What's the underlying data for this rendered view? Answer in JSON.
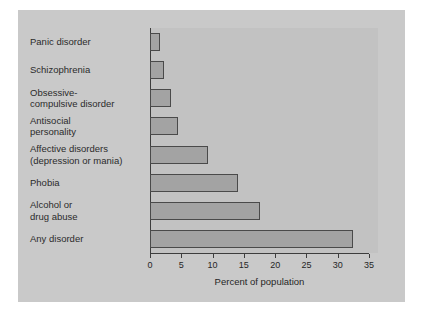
{
  "chart_data": {
    "type": "bar",
    "orientation": "horizontal",
    "title": "",
    "xlabel": "Percent of population",
    "ylabel": "",
    "xlim": [
      0,
      35
    ],
    "xticks": [
      0,
      5,
      10,
      15,
      20,
      25,
      30,
      35
    ],
    "xtick_labels": [
      "0",
      "5",
      "10",
      "15",
      "20",
      "25",
      "30",
      "35"
    ],
    "grid": false,
    "legend": null,
    "categories": [
      "Panic disorder",
      "Schizophrenia",
      "Obsessive-\ncompulsive disorder",
      "Antisocial\npersonality",
      "Affective disorders\n(depression or mania)",
      "Phobia",
      "Alcohol or\ndrug abuse",
      "Any disorder"
    ],
    "values": [
      1.6,
      2.2,
      3.3,
      4.5,
      9.3,
      14.0,
      17.6,
      32.5
    ],
    "colors": {
      "figure_background": "#c9c9c9",
      "plot_background": "#c2c2c2",
      "bar_fill": "#a3a3a3",
      "bar_edge": "#4a4a4a",
      "axis": "#3d3d3d",
      "text": "#262626",
      "page_background": "#ffffff"
    }
  }
}
